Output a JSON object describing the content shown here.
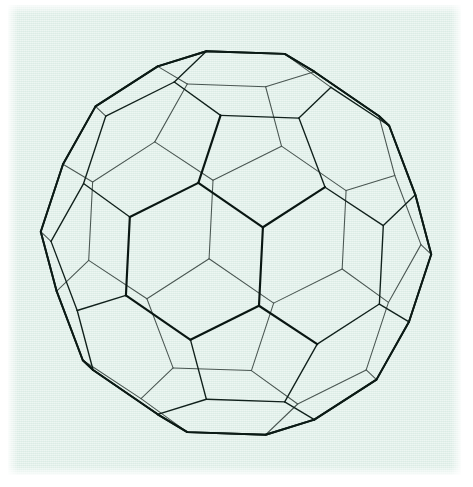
{
  "figure": {
    "alt_names": [
      "buckyball",
      "buckminsterfullerene cage",
      "soccer ball polyhedron"
    ],
    "drawing_style": "wireframe line drawing, hidden edges shown as thin lines",
    "background_color": "#e2f0ea",
    "plate_border_color": "#ffffff",
    "line_color": "#10201b",
    "bold_line_color": "#091612",
    "back_line_color": "#27332f",
    "caption": "",
    "plate": {
      "x": 8,
      "y": 5,
      "width": 453,
      "height": 470
    }
  },
  "geometry": {
    "name": "truncated icosahedron",
    "faces_total": 32,
    "hexagons": 20,
    "pentagons": 12,
    "vertices": 60,
    "edges": 90,
    "projection": "orthographic",
    "view_rotation_x_deg": -14,
    "view_rotation_y_deg": 8,
    "view_rotation_z_deg": 0,
    "scale": 196,
    "center_x": 236,
    "center_y": 243,
    "silhouette": {
      "top_edge_y": 57,
      "bottom_edge_y": 432,
      "left_edge_x": 42,
      "right_edge_x": 432,
      "top_edge_x_range": [
        173,
        297
      ],
      "bottom_edge_x_range": [
        195,
        278
      ]
    },
    "front_faces": {
      "center_face": "hexagon",
      "upper_face": "pentagon",
      "lower_face": "pentagon"
    }
  },
  "chart_data": {
    "type": "diagram",
    "counts": {
      "vertices": 60,
      "edges": 90,
      "faces": 32,
      "hexagonal_faces": 20,
      "pentagonal_faces": 12
    }
  }
}
